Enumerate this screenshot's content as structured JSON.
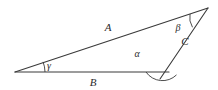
{
  "figure": {
    "type": "geometry-diagram",
    "background_color": "#ffffff",
    "line_color": "#3a3a3a",
    "text_color": "#2b2b2b",
    "vertices": [
      {
        "name": "left-vertex",
        "x": 15,
        "y": 72,
        "angle_label": "gamma"
      },
      {
        "name": "bottom-right-vertex",
        "x": 166,
        "y": 72,
        "angle_label": "alpha"
      },
      {
        "name": "apex-vertex",
        "x": 208,
        "y": 8,
        "angle_label": "beta"
      }
    ],
    "sides": [
      {
        "name": "side-a",
        "label": "A",
        "from": "left-vertex",
        "to": "apex-vertex",
        "label_x": 108,
        "label_y": 31
      },
      {
        "name": "side-b",
        "label": "B",
        "from": "left-vertex",
        "to": "bottom-right-vertex",
        "label_x": 93,
        "label_y": 86
      },
      {
        "name": "side-c",
        "label": "C",
        "from": "bottom-right-vertex",
        "to": "apex-vertex",
        "label_x": 185,
        "label_y": 45
      }
    ],
    "angles": [
      {
        "name": "angle-alpha",
        "label": "α",
        "vertex": "bottom-right-vertex",
        "label_x": 137,
        "label_y": 57
      },
      {
        "name": "angle-beta",
        "label": "β",
        "vertex": "apex-vertex",
        "label_x": 178,
        "label_y": 31
      },
      {
        "name": "angle-gamma",
        "label": "γ",
        "vertex": "left-vertex",
        "label_x": 49,
        "label_y": 69
      }
    ]
  }
}
